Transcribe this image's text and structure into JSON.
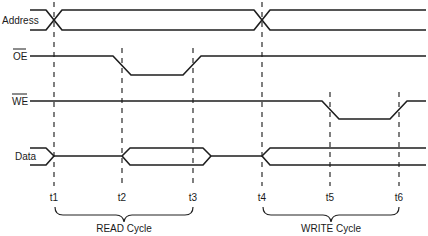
{
  "diagram": {
    "type": "timing-diagram",
    "signals": [
      {
        "name": "Address",
        "overline": false,
        "kind": "bus"
      },
      {
        "name": "OE",
        "overline": true,
        "kind": "active-low",
        "low_interval": [
          "t2",
          "t3"
        ]
      },
      {
        "name": "WE",
        "overline": true,
        "kind": "active-low",
        "low_interval": [
          "t5",
          "t6"
        ]
      },
      {
        "name": "Data",
        "overline": false,
        "kind": "bus",
        "valid_intervals": [
          [
            "t2",
            "t3"
          ],
          [
            "t4",
            "end"
          ]
        ]
      }
    ],
    "time_markers": [
      "t1",
      "t2",
      "t3",
      "t4",
      "t5",
      "t6"
    ],
    "cycles": [
      {
        "label": "READ Cycle",
        "from": "t1",
        "to": "t3"
      },
      {
        "label": "WRITE Cycle",
        "from": "t4",
        "to": "t6"
      }
    ],
    "colors": {
      "line": "#1e1e1e",
      "background": "#ffffff"
    }
  },
  "labels": {
    "address": "Address",
    "oe": "OE",
    "we": "WE",
    "data": "Data",
    "t1": "t1",
    "t2": "t2",
    "t3": "t3",
    "t4": "t4",
    "t5": "t5",
    "t6": "t6",
    "read_cycle": "READ Cycle",
    "write_cycle": "WRITE Cycle"
  }
}
